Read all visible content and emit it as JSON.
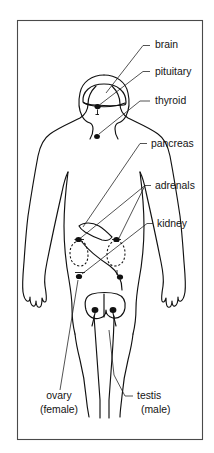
{
  "figure": {
    "colors": {
      "background": "#ffffff",
      "ink": "#111111",
      "frame": "#4a4a4a"
    },
    "labels": [
      {
        "id": "brain",
        "text": "brain",
        "x": 155,
        "y": 48,
        "anchor": "start"
      },
      {
        "id": "pituitary",
        "text": "pituitary",
        "x": 155,
        "y": 75,
        "anchor": "start"
      },
      {
        "id": "thyroid",
        "text": "thyroid",
        "x": 155,
        "y": 104,
        "anchor": "start"
      },
      {
        "id": "pancreas",
        "text": "pancreas",
        "x": 151,
        "y": 147,
        "anchor": "start"
      },
      {
        "id": "adrenals",
        "text": "adrenals",
        "x": 155,
        "y": 189,
        "anchor": "start"
      },
      {
        "id": "kidney",
        "text": "kidney",
        "x": 157,
        "y": 227,
        "anchor": "start"
      },
      {
        "id": "ovary",
        "text": "ovary",
        "x": 59,
        "y": 399,
        "anchor": "middle"
      },
      {
        "id": "ovary_qualifier",
        "text": "(female)",
        "x": 59,
        "y": 413,
        "anchor": "middle"
      },
      {
        "id": "testis",
        "text": "testis",
        "x": 137,
        "y": 399,
        "anchor": "start"
      },
      {
        "id": "testis_qualifier",
        "text": "(male)",
        "x": 141,
        "y": 413,
        "anchor": "start"
      }
    ],
    "organs": [
      {
        "id": "brain",
        "kind": "outline-double",
        "note": "skull and brain contour in head"
      },
      {
        "id": "pituitary",
        "kind": "dot",
        "note": "base of brain"
      },
      {
        "id": "thyroid",
        "kind": "dot",
        "note": "neck / upper chest"
      },
      {
        "id": "pancreas",
        "kind": "solid",
        "note": "upper abdomen, elongated tapered shape"
      },
      {
        "id": "adrenals",
        "kind": "dot",
        "note": "caps on top of both kidneys"
      },
      {
        "id": "kidney",
        "kind": "dashed",
        "note": "paired dashed bean outlines"
      },
      {
        "id": "ovary",
        "kind": "dot",
        "note": "lower abdomen, paired (female)"
      },
      {
        "id": "testis",
        "kind": "dot",
        "note": "pelvis, paired (male)"
      }
    ]
  }
}
